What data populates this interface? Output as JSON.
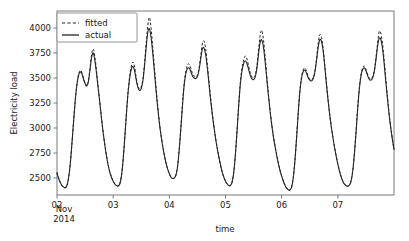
{
  "chart_data": {
    "type": "line",
    "title": "",
    "xlabel": "time",
    "ylabel": "Electricity load",
    "grid": false,
    "legend_position": "upper left",
    "xlim": [
      2.0,
      8.0
    ],
    "ylim": [
      2330,
      4170
    ],
    "yticks": [
      2500,
      2750,
      3000,
      3250,
      3500,
      3750,
      4000
    ],
    "ytick_labels": [
      "2500",
      "2750",
      "3000",
      "3250",
      "3500",
      "3750",
      "4000"
    ],
    "xticks": [
      2,
      3,
      4,
      5,
      6,
      7
    ],
    "xtick_labels": [
      "02",
      "03",
      "04",
      "05",
      "06",
      "07"
    ],
    "xtick_sublabels": [
      "Nov",
      "2014"
    ],
    "x_unit": "day of November 2014 (fractional, hourly samples)",
    "series": [
      {
        "name": "fitted",
        "style": "dashed",
        "color": "#262626",
        "values": [
          2560,
          2500,
          2455,
          2420,
          2405,
          2400,
          2420,
          2500,
          2640,
          2840,
          3060,
          3270,
          3430,
          3530,
          3575,
          3560,
          3500,
          3450,
          3420,
          3470,
          3600,
          3740,
          3790,
          3700,
          3560,
          3400,
          3250,
          3090,
          2950,
          2830,
          2720,
          2630,
          2560,
          2510,
          2470,
          2440,
          2425,
          2420,
          2440,
          2520,
          2680,
          2900,
          3140,
          3360,
          3520,
          3620,
          3660,
          3610,
          3500,
          3420,
          3390,
          3410,
          3490,
          3650,
          3850,
          4030,
          4105,
          3990,
          3800,
          3600,
          3400,
          3220,
          3060,
          2930,
          2820,
          2730,
          2650,
          2590,
          2545,
          2510,
          2495,
          2500,
          2530,
          2620,
          2790,
          3010,
          3250,
          3450,
          3570,
          3630,
          3640,
          3600,
          3545,
          3520,
          3510,
          3530,
          3600,
          3720,
          3840,
          3870,
          3790,
          3640,
          3470,
          3300,
          3150,
          3020,
          2900,
          2800,
          2710,
          2630,
          2560,
          2510,
          2470,
          2440,
          2425,
          2425,
          2460,
          2560,
          2740,
          2980,
          3240,
          3460,
          3600,
          3680,
          3720,
          3690,
          3620,
          3550,
          3510,
          3500,
          3530,
          3620,
          3780,
          3930,
          3975,
          3880,
          3710,
          3520,
          3340,
          3180,
          3040,
          2920,
          2820,
          2730,
          2650,
          2580,
          2520,
          2470,
          2430,
          2400,
          2385,
          2380,
          2410,
          2500,
          2670,
          2900,
          3150,
          3370,
          3510,
          3580,
          3600,
          3570,
          3520,
          3490,
          3480,
          3500,
          3560,
          3680,
          3830,
          3930,
          3915,
          3810,
          3650,
          3470,
          3300,
          3150,
          3020,
          2910,
          2810,
          2720,
          2640,
          2570,
          2515,
          2470,
          2440,
          2425,
          2420,
          2430,
          2470,
          2570,
          2740,
          2960,
          3200,
          3400,
          3530,
          3600,
          3620,
          3590,
          3540,
          3500,
          3490,
          3510,
          3570,
          3690,
          3840,
          3960,
          3950,
          3850,
          3690,
          3500,
          3320,
          3150,
          3010,
          2890,
          2790
        ]
      },
      {
        "name": "actual",
        "style": "solid",
        "color": "#262626",
        "values": [
          2545,
          2495,
          2455,
          2425,
          2410,
          2405,
          2425,
          2500,
          2635,
          2835,
          3055,
          3265,
          3425,
          3525,
          3560,
          3545,
          3490,
          3445,
          3420,
          3465,
          3585,
          3710,
          3750,
          3665,
          3535,
          3385,
          3240,
          3085,
          2945,
          2825,
          2715,
          2625,
          2555,
          2505,
          2468,
          2440,
          2425,
          2420,
          2440,
          2518,
          2675,
          2895,
          3135,
          3350,
          3500,
          3590,
          3615,
          3570,
          3475,
          3405,
          3375,
          3395,
          3470,
          3620,
          3810,
          3960,
          3990,
          3900,
          3740,
          3555,
          3365,
          3195,
          3045,
          2920,
          2815,
          2725,
          2648,
          2588,
          2543,
          2508,
          2495,
          2500,
          2528,
          2615,
          2785,
          3000,
          3235,
          3430,
          3545,
          3595,
          3600,
          3565,
          3520,
          3500,
          3495,
          3515,
          3580,
          3690,
          3790,
          3800,
          3730,
          3600,
          3440,
          3280,
          3135,
          3010,
          2895,
          2795,
          2708,
          2628,
          2558,
          2508,
          2468,
          2440,
          2425,
          2425,
          2458,
          2555,
          2732,
          2968,
          3225,
          3440,
          3575,
          3645,
          3672,
          3645,
          3585,
          3525,
          3492,
          3485,
          3512,
          3595,
          3740,
          3860,
          3880,
          3805,
          3660,
          3490,
          3320,
          3165,
          3030,
          2912,
          2815,
          2725,
          2645,
          2575,
          2518,
          2468,
          2428,
          2398,
          2383,
          2378,
          2408,
          2497,
          2665,
          2893,
          3142,
          3358,
          3495,
          3562,
          3578,
          3550,
          3505,
          3478,
          3470,
          3490,
          3548,
          3660,
          3795,
          3880,
          3872,
          3782,
          3630,
          3455,
          3290,
          3142,
          3015,
          2905,
          2805,
          2718,
          2638,
          2568,
          2512,
          2468,
          2438,
          2422,
          2418,
          2428,
          2468,
          2565,
          2732,
          2950,
          3190,
          3388,
          3518,
          3585,
          3602,
          3572,
          3525,
          3488,
          3478,
          3498,
          3558,
          3672,
          3810,
          3895,
          3888,
          3800,
          3650,
          3470,
          3300,
          3140,
          3005,
          2888,
          2785
        ]
      }
    ]
  },
  "legend": {
    "items": [
      {
        "label": "fitted",
        "style": "dashed"
      },
      {
        "label": "actual",
        "style": "solid"
      }
    ]
  }
}
